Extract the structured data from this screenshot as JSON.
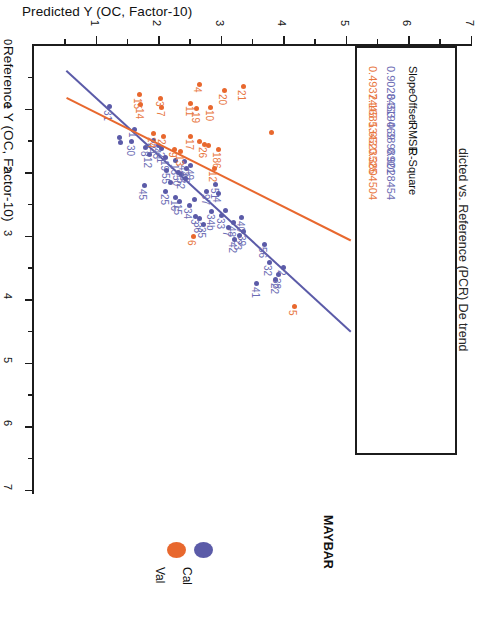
{
  "chart_data": {
    "type": "scatter",
    "title": "dicted vs. Reference (PCR) De trend",
    "xlabel": "Predicted Y (OC, Factor-10)",
    "ylabel": "Reference Y (OC, Factor-10)",
    "xlim": [
      0,
      7
    ],
    "ylim": [
      0,
      7
    ],
    "xticks": [
      "1",
      "2",
      "3",
      "4",
      "5",
      "6",
      "7"
    ],
    "yticks": [
      "0",
      "1",
      "2",
      "3",
      "4",
      "5",
      "6",
      "7"
    ],
    "grid": false,
    "legend_position": "bottom",
    "legend_title": "MAYBAR",
    "series": [
      {
        "name": "Cal",
        "color": "#5b5ba8",
        "fit": {
          "slope": 0.9028453,
          "offset": 0.319469
        },
        "points": [
          {
            "label": "31",
            "x": 1.22,
            "y": 0.97
          },
          {
            "label": "1",
            "x": 1.62,
            "y": 1.33
          },
          {
            "label": "30",
            "x": 1.58,
            "y": 1.52
          },
          {
            "label": "",
            "x": 1.38,
            "y": 1.45
          },
          {
            "label": "",
            "x": 1.4,
            "y": 1.53
          },
          {
            "label": "8",
            "x": 1.8,
            "y": 1.62
          },
          {
            "label": "12",
            "x": 1.86,
            "y": 1.72
          },
          {
            "label": "24",
            "x": 1.92,
            "y": 1.5
          },
          {
            "label": "43",
            "x": 2.0,
            "y": 1.58
          },
          {
            "label": "21",
            "x": 2.06,
            "y": 1.63
          },
          {
            "label": "19",
            "x": 2.12,
            "y": 1.77
          },
          {
            "label": "13",
            "x": 2.28,
            "y": 1.82
          },
          {
            "label": "44",
            "x": 2.42,
            "y": 1.84
          },
          {
            "label": "49",
            "x": 2.52,
            "y": 1.9
          },
          {
            "label": "55",
            "x": 2.14,
            "y": 1.97
          },
          {
            "label": "52",
            "x": 2.38,
            "y": 2.04
          },
          {
            "label": "50",
            "x": 2.32,
            "y": 2.0
          },
          {
            "label": "18",
            "x": 2.46,
            "y": 1.95
          },
          {
            "label": "45",
            "x": 1.78,
            "y": 2.22
          },
          {
            "label": "25",
            "x": 2.12,
            "y": 2.3
          },
          {
            "label": "16",
            "x": 2.28,
            "y": 2.4
          },
          {
            "label": "15",
            "x": 2.34,
            "y": 2.46
          },
          {
            "label": "34",
            "x": 2.5,
            "y": 2.52
          },
          {
            "label": "97",
            "x": 2.78,
            "y": 2.3
          },
          {
            "label": "51",
            "x": 2.92,
            "y": 2.2
          },
          {
            "label": "4",
            "x": 2.96,
            "y": 2.34
          },
          {
            "label": "34b",
            "x": 2.86,
            "y": 2.62
          },
          {
            "label": "33",
            "x": 3.02,
            "y": 2.68
          },
          {
            "label": "36",
            "x": 2.66,
            "y": 2.74
          },
          {
            "label": "3",
            "x": 2.6,
            "y": 2.7
          },
          {
            "label": "35",
            "x": 2.72,
            "y": 2.82
          },
          {
            "label": "48",
            "x": 3.2,
            "y": 2.8
          },
          {
            "label": "40",
            "x": 3.34,
            "y": 2.72
          },
          {
            "label": "7",
            "x": 3.12,
            "y": 2.88
          },
          {
            "label": "39",
            "x": 3.36,
            "y": 2.94
          },
          {
            "label": "23",
            "x": 3.3,
            "y": 3.0
          },
          {
            "label": "42",
            "x": 3.22,
            "y": 3.06
          },
          {
            "label": "56",
            "x": 3.7,
            "y": 3.14
          },
          {
            "label": "32",
            "x": 3.78,
            "y": 3.42
          },
          {
            "label": "2",
            "x": 4.0,
            "y": 3.5
          },
          {
            "label": "38",
            "x": 3.92,
            "y": 3.62
          },
          {
            "label": "22",
            "x": 3.88,
            "y": 3.7
          },
          {
            "label": "41",
            "x": 3.58,
            "y": 3.76
          },
          {
            "label": "",
            "x": 2.44,
            "y": 2.1
          },
          {
            "label": "",
            "x": 2.2,
            "y": 2.16
          },
          {
            "label": "",
            "x": 2.58,
            "y": 2.44
          },
          {
            "label": "",
            "x": 3.08,
            "y": 2.6
          }
        ]
      },
      {
        "name": "Val",
        "color": "#e8682e",
        "fit": {
          "slope": 0.4937445,
          "offset": 2.1685343
        },
        "points": [
          {
            "label": "15",
            "x": 1.7,
            "y": 0.78
          },
          {
            "label": "14",
            "x": 1.72,
            "y": 0.94
          },
          {
            "label": "3",
            "x": 2.04,
            "y": 0.84
          },
          {
            "label": "7",
            "x": 2.06,
            "y": 0.99
          },
          {
            "label": "4",
            "x": 2.66,
            "y": 0.62
          },
          {
            "label": "20",
            "x": 3.06,
            "y": 0.72
          },
          {
            "label": "21",
            "x": 3.36,
            "y": 0.66
          },
          {
            "label": "11",
            "x": 2.52,
            "y": 0.92
          },
          {
            "label": "19",
            "x": 2.62,
            "y": 1.0
          },
          {
            "label": "10",
            "x": 2.84,
            "y": 0.98
          },
          {
            "label": "2",
            "x": 2.08,
            "y": 1.44
          },
          {
            "label": "24",
            "x": 1.92,
            "y": 1.4
          },
          {
            "label": "17",
            "x": 2.52,
            "y": 1.44
          },
          {
            "label": "26",
            "x": 2.74,
            "y": 1.56
          },
          {
            "label": "9",
            "x": 2.26,
            "y": 1.64
          },
          {
            "label": "13",
            "x": 2.36,
            "y": 1.68
          },
          {
            "label": "186",
            "x": 2.96,
            "y": 1.64
          },
          {
            "label": "12",
            "x": 2.9,
            "y": 1.94
          },
          {
            "label": "6",
            "x": 2.56,
            "y": 3.02
          },
          {
            "label": "5",
            "x": 4.18,
            "y": 4.12
          },
          {
            "label": "",
            "x": 3.82,
            "y": 1.38
          },
          {
            "label": "",
            "x": 2.66,
            "y": 1.52
          },
          {
            "label": "",
            "x": 2.8,
            "y": 1.58
          }
        ]
      }
    ]
  },
  "stats_table": {
    "row_labels": [
      "Cal",
      "Val"
    ],
    "columns": [
      {
        "header": "Slope",
        "cal": "0.9028453",
        "val": "0.4937445"
      },
      {
        "header": "Offset",
        "cal": "0.319469",
        "val": "2.1685343"
      },
      {
        "header": "RMSE",
        "cal": "0.3898921",
        "val": "1.6523525"
      },
      {
        "header": "R-Square",
        "cal": "0.9028454",
        "val": "0.3804504"
      }
    ]
  },
  "legend": {
    "title": "MAYBAR",
    "entries": [
      {
        "label": "Val",
        "color": "#e8682e"
      },
      {
        "label": "Cal",
        "color": "#5b5ba8"
      }
    ]
  },
  "colors": {
    "cal": "#5b5ba8",
    "val": "#e8682e",
    "axis": "#1c1c1c"
  }
}
